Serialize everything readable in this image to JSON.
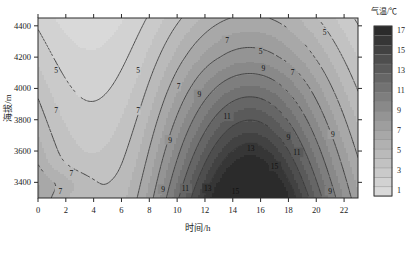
{
  "chart_data": {
    "type": "heatmap",
    "title": "",
    "xlabel": "时间/h",
    "ylabel": "海拔/m",
    "xlim": [
      0,
      23
    ],
    "ylim": [
      3300,
      4450
    ],
    "xticks": [
      0,
      2,
      4,
      6,
      8,
      10,
      12,
      14,
      16,
      18,
      20,
      22
    ],
    "yticks": [
      3400,
      3600,
      3800,
      4000,
      4200,
      4400
    ],
    "xtick_labels": [
      "0",
      "2",
      "4",
      "6",
      "8",
      "10",
      "12",
      "14",
      "16",
      "18",
      "20",
      "22"
    ],
    "ytick_labels": [
      "3400",
      "3600",
      "3800",
      "4000",
      "4200",
      "4400"
    ],
    "grid": false,
    "legend": "none",
    "colorbar": {
      "title": "气温/℃",
      "ticks": [
        1,
        3,
        5,
        7,
        9,
        11,
        13,
        15,
        17
      ],
      "tick_labels": [
        "1",
        "3",
        "5",
        "7",
        "9",
        "11",
        "13",
        "15",
        "17"
      ],
      "min": 1,
      "max": 18,
      "band_step": 1,
      "colors": [
        "#d9d9d9",
        "#d2d2d2",
        "#cacaca",
        "#c2c2c2",
        "#bababa",
        "#b1b1b1",
        "#a8a8a8",
        "#9e9e9e",
        "#949494",
        "#898989",
        "#7e7e7e",
        "#727272",
        "#666666",
        "#5a5a5a",
        "#4e4e4e",
        "#424242",
        "#363636",
        "#2b2b2b"
      ]
    },
    "contour_levels": [
      1,
      3,
      5,
      7,
      9,
      11,
      13,
      15,
      17
    ],
    "contour_labels": [
      "1",
      "3",
      "5",
      "7",
      "9",
      "11",
      "13",
      "15",
      "17"
    ],
    "variable": "气温",
    "units": "℃",
    "annotations": [
      {
        "label": "5",
        "x": 1.3,
        "y": 4115
      },
      {
        "label": "5",
        "x": 7.2,
        "y": 4115
      },
      {
        "label": "5",
        "x": 16.0,
        "y": 4235
      },
      {
        "label": "5",
        "x": 20.6,
        "y": 4355
      },
      {
        "label": "7",
        "x": 1.3,
        "y": 3860
      },
      {
        "label": "7",
        "x": 7.2,
        "y": 3860
      },
      {
        "label": "7",
        "x": 10.1,
        "y": 4010
      },
      {
        "label": "7",
        "x": 13.6,
        "y": 4305
      },
      {
        "label": "7",
        "x": 18.3,
        "y": 4100
      },
      {
        "label": "7",
        "x": 2.4,
        "y": 3460
      },
      {
        "label": "7",
        "x": 1.6,
        "y": 3345
      },
      {
        "label": "9",
        "x": 11.6,
        "y": 3960
      },
      {
        "label": "9",
        "x": 16.2,
        "y": 4125
      },
      {
        "label": "9",
        "x": 9.5,
        "y": 3670
      },
      {
        "label": "9",
        "x": 18.0,
        "y": 3690
      },
      {
        "label": "9",
        "x": 9.0,
        "y": 3355
      },
      {
        "label": "9",
        "x": 21.2,
        "y": 3705
      },
      {
        "label": "9",
        "x": 21.0,
        "y": 3345
      },
      {
        "label": "11",
        "x": 13.6,
        "y": 3820
      },
      {
        "label": "11",
        "x": 18.6,
        "y": 3590
      },
      {
        "label": "11",
        "x": 10.6,
        "y": 3360
      },
      {
        "label": "13",
        "x": 15.3,
        "y": 3620
      },
      {
        "label": "13",
        "x": 12.2,
        "y": 3360
      },
      {
        "label": "15",
        "x": 14.2,
        "y": 3345
      },
      {
        "label": "15",
        "x": 17.0,
        "y": 3500
      }
    ]
  },
  "figure": {
    "background": "#ffffff",
    "plot_background": "#d9d9d9",
    "frame_color": "#2b2b2b",
    "contour_color": "#3a3a3a"
  }
}
